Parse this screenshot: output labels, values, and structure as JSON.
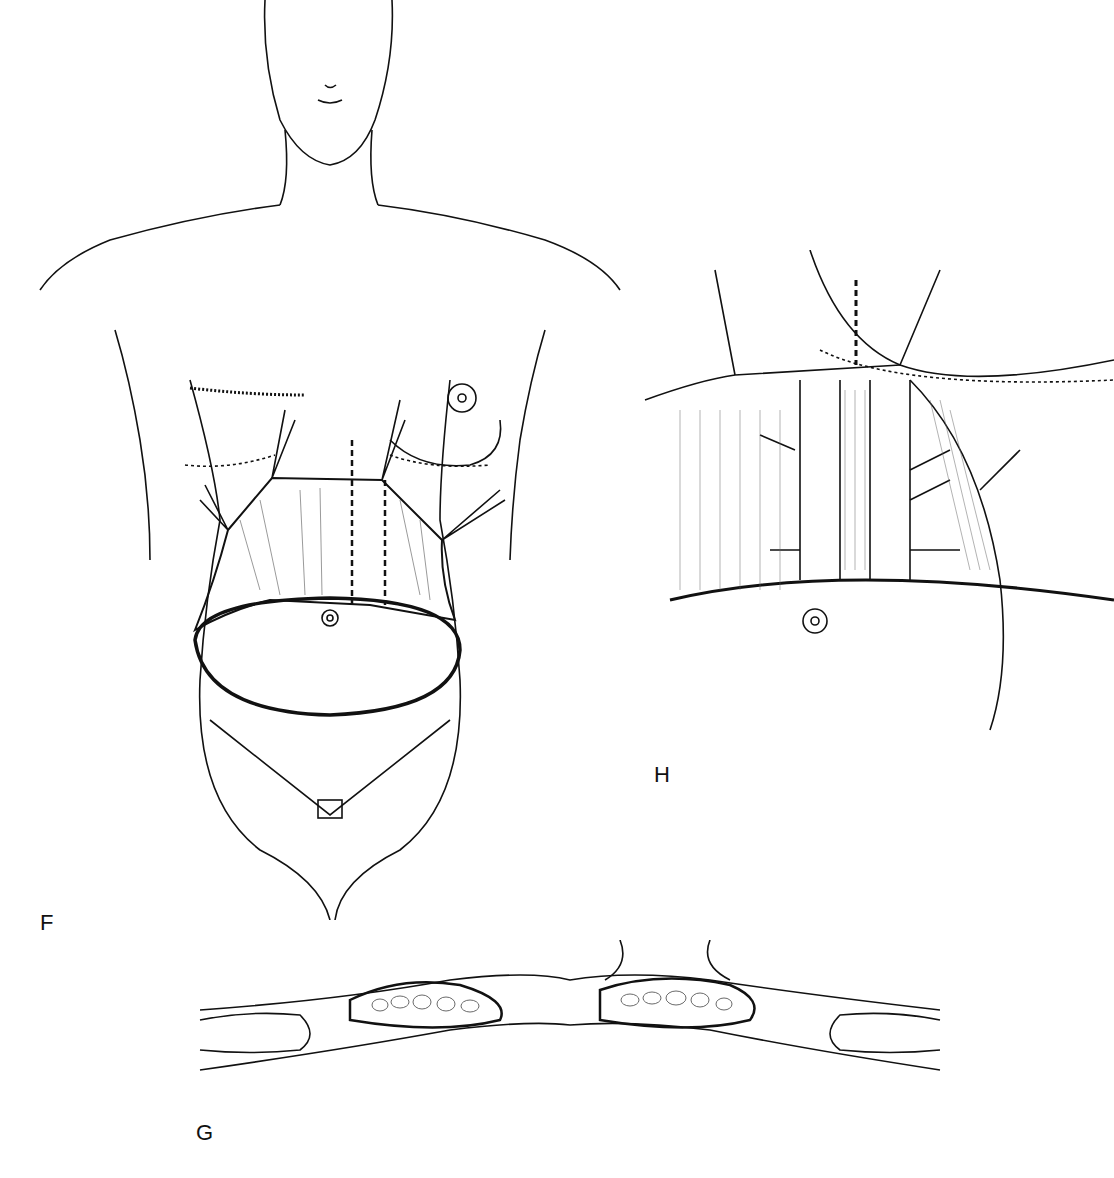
{
  "figure": {
    "panels": [
      {
        "id": "F",
        "label": "F",
        "description": "Frontal view of female torso showing abdominal flap elevation with midline rectus plication markings"
      },
      {
        "id": "G",
        "label": "G",
        "description": "Cross-section of abdominal wall showing rectus muscles and fascia"
      },
      {
        "id": "H",
        "label": "H",
        "description": "Close-up of rectus fascia plication with retracted flap edges"
      }
    ]
  }
}
